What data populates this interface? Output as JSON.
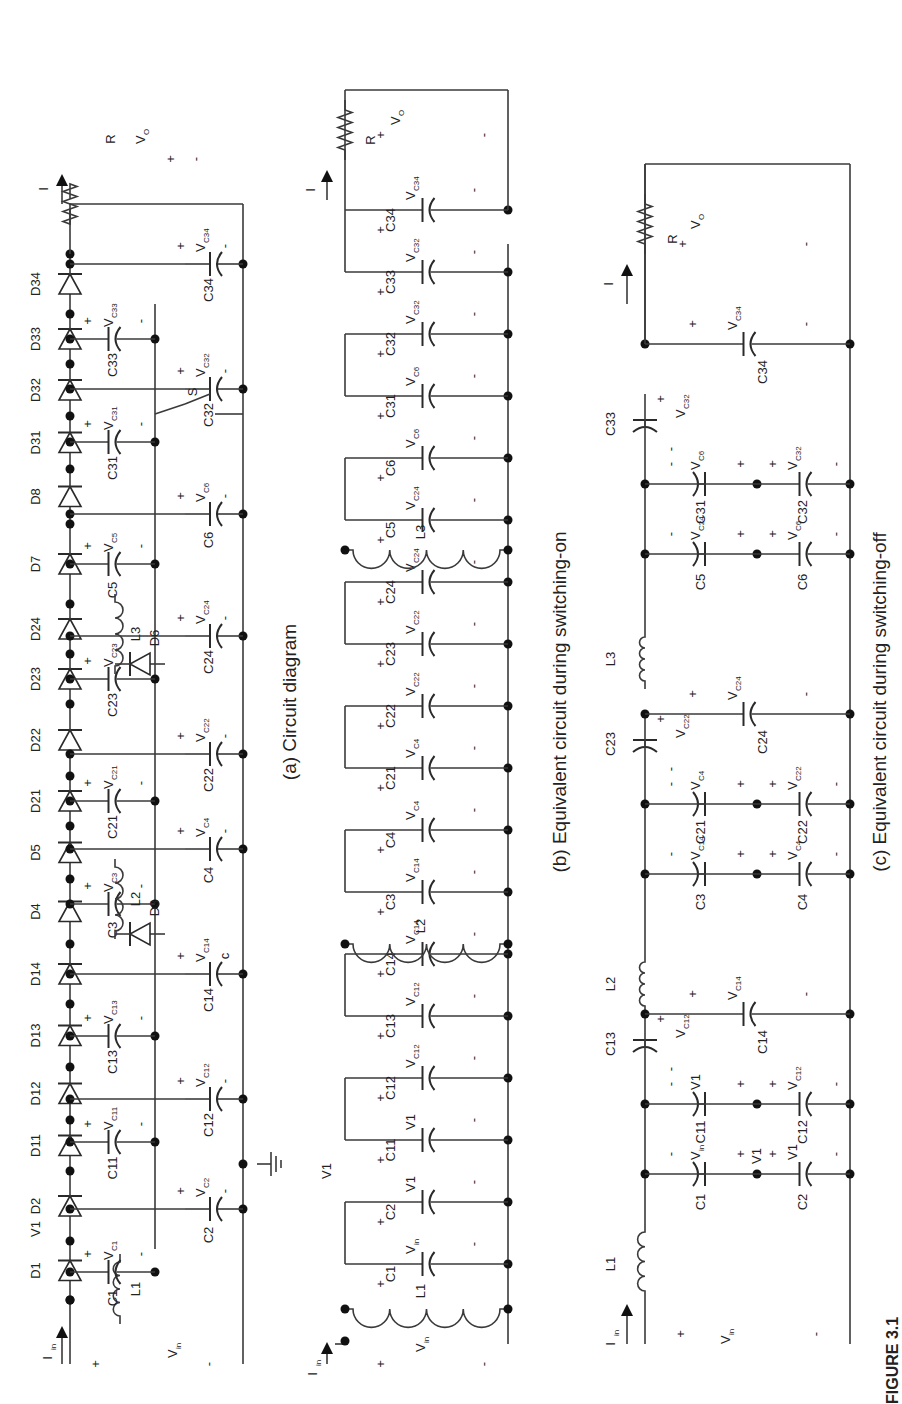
{
  "figure": {
    "label": "FIGURE 3.1",
    "orientation": "rotated 90 degrees counter-clockwise"
  },
  "panels": [
    {
      "id": "a",
      "caption": "(a) Circuit diagram",
      "input": {
        "current": "I",
        "current_sub": "in",
        "voltage": "V",
        "voltage_sub": "in",
        "plus": "+",
        "minus": "-"
      },
      "output": {
        "current": "I",
        "current_sub": "O",
        "voltage": "V",
        "voltage_sub": "O",
        "resistor": "R",
        "plus": "+",
        "minus": "-"
      },
      "node_label": "V1",
      "diodes": [
        "D1",
        "D2",
        "D11",
        "D12",
        "D13",
        "D14",
        "D4",
        "D5",
        "D21",
        "D22",
        "D23",
        "D24",
        "D7",
        "D8",
        "D31",
        "D32",
        "D33",
        "D34"
      ],
      "shunt_diodes": [
        "D3",
        "D6"
      ],
      "inductors": [
        "L1",
        "L2",
        "L3"
      ],
      "switch": "S",
      "ground": "ground",
      "capacitors_top": [
        {
          "name": "C1",
          "v": "C1"
        },
        {
          "name": "C11",
          "v": "C11"
        },
        {
          "name": "C13",
          "v": "C13"
        },
        {
          "name": "C3",
          "v": "C3"
        },
        {
          "name": "C21",
          "v": "C21"
        },
        {
          "name": "C23",
          "v": "C23"
        },
        {
          "name": "C5",
          "v": "C5"
        },
        {
          "name": "C31",
          "v": "C31"
        },
        {
          "name": "C33",
          "v": "C33"
        }
      ],
      "capacitors_bottom": [
        {
          "name": "C2",
          "v": "C2"
        },
        {
          "name": "C12",
          "v": "C12"
        },
        {
          "name": "C14",
          "v": "C14",
          "extra": "c"
        },
        {
          "name": "C4",
          "v": "C4"
        },
        {
          "name": "C22",
          "v": "C22"
        },
        {
          "name": "C24",
          "v": "C24"
        },
        {
          "name": "C6",
          "v": "C6"
        },
        {
          "name": "C32",
          "v": "C32"
        },
        {
          "name": "C34",
          "v": "C34"
        }
      ]
    },
    {
      "id": "b",
      "caption": "(b) Equivalent circuit during switching-on",
      "input": {
        "current": "I",
        "current_sub": "in",
        "voltage": "V",
        "voltage_sub": "in",
        "plus": "+",
        "minus": "-"
      },
      "output": {
        "current": "I",
        "current_sub": "O",
        "voltage": "V",
        "voltage_sub": "O",
        "resistor": "R",
        "plus": "+",
        "minus": "-"
      },
      "node_label": "V1",
      "inductors": [
        "L1",
        "L2",
        "L3"
      ],
      "capacitors": [
        {
          "name": "C1",
          "v": "V",
          "sub": "in"
        },
        {
          "name": "C2",
          "v": "V1",
          "sub": ""
        },
        {
          "name": "C11",
          "v": "V1",
          "sub": ""
        },
        {
          "name": "C12",
          "v": "V",
          "sub": "C12"
        },
        {
          "name": "C13",
          "v": "V",
          "sub": "C12"
        },
        {
          "name": "C14",
          "v": "V",
          "sub": "C14"
        },
        {
          "name": "C3",
          "v": "V",
          "sub": "C14"
        },
        {
          "name": "C4",
          "v": "V",
          "sub": "C4"
        },
        {
          "name": "C21",
          "v": "V",
          "sub": "C4"
        },
        {
          "name": "C22",
          "v": "V",
          "sub": "C22"
        },
        {
          "name": "C23",
          "v": "V",
          "sub": "C22"
        },
        {
          "name": "C24",
          "v": "V",
          "sub": "C24"
        },
        {
          "name": "C5",
          "v": "V",
          "sub": "C24"
        },
        {
          "name": "C6",
          "v": "V",
          "sub": "C6"
        },
        {
          "name": "C31",
          "v": "V",
          "sub": "C6"
        },
        {
          "name": "C32",
          "v": "V",
          "sub": "C32"
        },
        {
          "name": "C33",
          "v": "V",
          "sub": "C32"
        },
        {
          "name": "C34",
          "v": "V",
          "sub": "C34"
        }
      ]
    },
    {
      "id": "c",
      "caption": "(c) Equivalent circuit during switching-off",
      "input": {
        "current": "I",
        "current_sub": "in",
        "voltage": "V",
        "voltage_sub": "in",
        "plus": "+",
        "minus": "-"
      },
      "output": {
        "current": "I",
        "current_sub": "O",
        "voltage": "V",
        "voltage_sub": "O",
        "resistor": "R",
        "plus": "+",
        "minus": "-"
      },
      "inductors": [
        "L1",
        "L2",
        "L3"
      ],
      "series_caps": [
        {
          "name": "C13",
          "v": "V",
          "sub": "C12"
        },
        {
          "name": "C23",
          "v": "V",
          "sub": "C22"
        },
        {
          "name": "C33",
          "v": "V",
          "sub": "C32"
        }
      ],
      "stacks": [
        {
          "top": {
            "name": "C1",
            "v": "V",
            "sub": "in"
          },
          "mid": "V1",
          "bottom": {
            "name": "C2",
            "v": "V1",
            "sub": ""
          }
        },
        {
          "top": {
            "name": "C11",
            "v": "V1",
            "sub": ""
          },
          "mid": "",
          "bottom": {
            "name": "C12",
            "v": "V",
            "sub": "C12"
          }
        },
        {
          "top": {
            "name": "C3",
            "v": "V",
            "sub": "C14"
          },
          "mid": "",
          "bottom": {
            "name": "C4",
            "v": "V",
            "sub": "C4"
          }
        },
        {
          "top": {
            "name": "C21",
            "v": "V",
            "sub": "C4"
          },
          "mid": "",
          "bottom": {
            "name": "C22",
            "v": "V",
            "sub": "C22"
          }
        },
        {
          "top": {
            "name": "C5",
            "v": "V",
            "sub": "C24"
          },
          "mid": "",
          "bottom": {
            "name": "C6",
            "v": "V",
            "sub": "C6"
          }
        },
        {
          "top": {
            "name": "C31",
            "v": "V",
            "sub": "C6"
          },
          "mid": "",
          "bottom": {
            "name": "C32",
            "v": "V",
            "sub": "C32"
          }
        }
      ],
      "shunt_caps": [
        {
          "name": "C14",
          "v": "V",
          "sub": "C14"
        },
        {
          "name": "C24",
          "v": "V",
          "sub": "C24"
        },
        {
          "name": "C34",
          "v": "V",
          "sub": "C34"
        }
      ]
    }
  ]
}
